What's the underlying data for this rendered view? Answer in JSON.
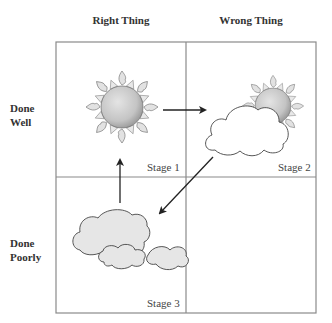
{
  "columns": [
    {
      "label": "Right Thing"
    },
    {
      "label": "Wrong Thing"
    }
  ],
  "rows": [
    {
      "line1": "Done",
      "line2": "Well"
    },
    {
      "line1": "Done",
      "line2": "Poorly"
    }
  ],
  "cells": [
    {
      "stage": "Stage 1",
      "icon": "sun-icon"
    },
    {
      "stage": "Stage 2",
      "icon": "sun-behind-cloud-icon"
    },
    {
      "stage": "Stage 3",
      "icon": "clouds-icon"
    },
    {
      "stage": "",
      "icon": ""
    }
  ],
  "colors": {
    "grid": "#8a8a8a",
    "sun_body": "#c8c8c8",
    "sun_ray": "#e2e2e2",
    "cloud_fill_white": "#ffffff",
    "cloud_fill_gray": "#e6e6e6",
    "outline": "#444444",
    "arrow": "#222222"
  }
}
